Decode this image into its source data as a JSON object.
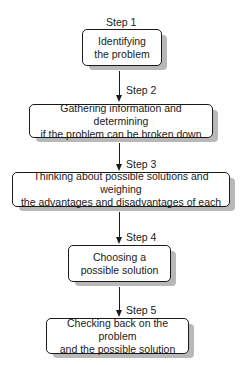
{
  "diagram": {
    "type": "flowchart",
    "steps": [
      {
        "label": "Step 1",
        "lines": [
          "Identifying",
          "the problem"
        ]
      },
      {
        "label": "Step 2",
        "lines": [
          "Gathering information and determining",
          "if the problem can be broken down"
        ]
      },
      {
        "label": "Step 3",
        "lines": [
          "Thinking about possible solutions and weighing",
          "the advantages and disadvantages of each"
        ]
      },
      {
        "label": "Step 4",
        "lines": [
          "Choosing a",
          "possible solution"
        ]
      },
      {
        "label": "Step 5",
        "lines": [
          "Checking back on the problem",
          "and the possible solution"
        ]
      }
    ],
    "colors": {
      "stroke": "#1a1a1a",
      "shadow": "#b8b8b8",
      "fill": "#ffffff"
    }
  }
}
